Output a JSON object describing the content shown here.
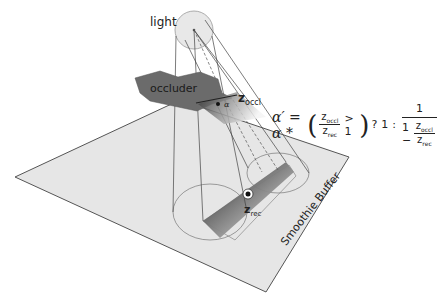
{
  "diagram": {
    "labels": {
      "light": "light",
      "occluder": "occluder",
      "z_occl_main": "z",
      "z_occl_sub": "occl",
      "z_rec_main": "z",
      "z_rec_sub": "rec",
      "alpha_small": "α",
      "alpha_rec_small": "α'",
      "buffer": "Smoothie Buffer"
    },
    "formula": {
      "lhs": "α′ = α *",
      "cond_num_main": "z",
      "cond_num_sub": "occl",
      "cond_den_main": "z",
      "cond_den_sub": "rec",
      "cond_op": "> 1",
      "ternary_q": "?",
      "true_val": "1",
      "ternary_colon": ":",
      "false_num": "1",
      "false_den_prefix": "1 −",
      "false_den_num_main": "z",
      "false_den_num_sub": "occl",
      "false_den_den_main": "z",
      "false_den_den_sub": "rec"
    },
    "colors": {
      "plane_fill": "#e6e6e6",
      "plane_stroke": "#555555",
      "occluder_fill": "#6b6b6b",
      "light_fill": "#e8e8e8",
      "line": "#444444"
    }
  }
}
